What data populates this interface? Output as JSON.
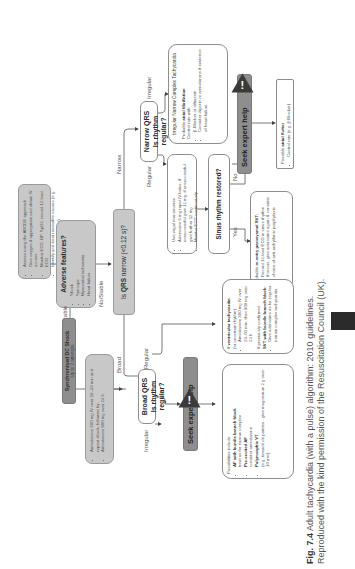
{
  "assess": {
    "items": [
      "Assess using the ABCDE approach",
      "Give oxygen if appropriate and obtain IV access",
      "Monitor ECG, BP, SpO2, record 12 lead ECG",
      "Identify and treat reversible causes (e.g. electrolyte abnormalities)"
    ]
  },
  "adverse": {
    "title": "Adverse features?",
    "items": [
      "Shock",
      "Syncope",
      "Myocardial ischaemia",
      "Heart failure"
    ]
  },
  "labels": {
    "yes_unstable": "Yes/Unstable",
    "no_stable": "No/Stable",
    "broad": "Broad",
    "narrow": "Narrow",
    "regular_narrow": "Regular",
    "irregular_narrow": "Irregular",
    "regular_broad": "Regular",
    "irregular_broad": "Irregular",
    "yes": "Yes",
    "no": "No"
  },
  "shock": {
    "title": "Synchronised DC Shock",
    "subtitle": "Up to 3 attempts"
  },
  "amiodarone": {
    "items": [
      "Amiodarone 300 mg IV over 10–20 min and repeat shock; followed by:",
      "Amiodarone 900 mg over 24 h"
    ]
  },
  "qrs": {
    "prefix": "Is ",
    "bold": "QRS",
    "suffix": " narrow (<0.12 s)?"
  },
  "narrow_q": {
    "line1": "Narrow QRS",
    "line2": "Is rhythm regular?"
  },
  "broad_q": {
    "line1": "Broad QRS",
    "line2": "Is rhythm regular?"
  },
  "vagal": {
    "items": [
      "Use vagal manoeuvres",
      "Adenosine 6 mg rapid IV bolus; if unsuccessful give 12 mg; if unsuccessful give further 12 mg",
      "Monitor ECG continuously"
    ]
  },
  "sinus_q": "Sinus rhythm restored?",
  "reentry": {
    "intro_pre": "Probable ",
    "intro_bold": "re-entry paroxysmal SVT:",
    "items": [
      "Record 12-lead ECG in sinus rhythm",
      "If recurs, give adenosine again & consider choice of anti-arrhythmic prophylaxis"
    ]
  },
  "irregular_narrow": {
    "title": "Irregular Narrow Complex Tachycardia",
    "intro_pre": "Probable ",
    "intro_bold": "atrial fibrillation",
    "control": "Control rate with:",
    "items": [
      "β-Blocker or diltiazem",
      "Consider digoxin or amiodarone if evidence of heart failure"
    ]
  },
  "seek": {
    "label": "Seek expert help",
    "icon": "warning-icon"
  },
  "flutter": {
    "intro_pre": "Possible ",
    "intro_bold": "atrial flutter",
    "items": [
      "Control rate (e.g. β-Blocker)"
    ]
  },
  "vt": {
    "head_pre": "If ",
    "head_bold": "ventricular tachycardia",
    "head_sub": "(or uncertain rhythm):",
    "items1": [
      "Amiodarone 300 mg IV over 20–60 min; then 900 mg over 24 h"
    ],
    "confirmed": "If previously confirmed",
    "svt_bold": "SVT with bundle branch block:",
    "items2": [
      "Give adenosine as for regular narrow complex tachycardia"
    ]
  },
  "possibilities": {
    "intro": "Possibilities include:",
    "items": [
      {
        "bold": "AF with bundle branch block",
        "rest": "treat as for narrow complex"
      },
      {
        "bold": "Pre-excited AF",
        "rest": "consider amiodarone"
      },
      {
        "bold": "Polymorphic VT",
        "rest": "(e.g. torsade de pointes - give magnesium 2 g over 10 min)"
      }
    ]
  },
  "caption": {
    "fig": "Fig. 7.4",
    "line1": "Adult tachycardia (with a pulse) algorithm: 2010 guidelines.",
    "line2": "Reproduced with the kind permission of the Resuscitation Council (UK)."
  }
}
